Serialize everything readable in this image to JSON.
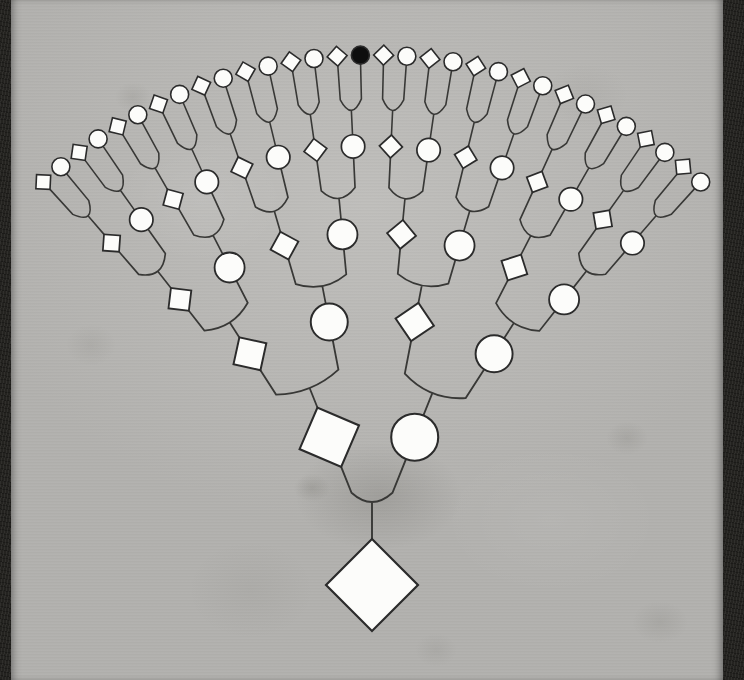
{
  "figure": {
    "paper_color": "#bdbcb9",
    "binding_color": "#242320",
    "shape_fill_color": "#fcfcfa",
    "shape_stroke_color": "#2b2b2b",
    "connector_color": "#383836",
    "filled_node_color": "#0e0e0e"
  },
  "chart_data": {
    "type": "pedigree-fan-tree",
    "pair_rule": "each fork joins a left diamond parent and a right circle parent to one child below",
    "generations": [
      {
        "level": 0,
        "role": "root",
        "nodes": [
          "diamond"
        ]
      },
      {
        "level": 1,
        "nodes": [
          "diamond",
          "circle"
        ]
      },
      {
        "level": 2,
        "nodes": [
          "diamond",
          "circle",
          "diamond",
          "circle"
        ]
      },
      {
        "level": 3,
        "nodes": [
          "diamond",
          "circle",
          "diamond",
          "circle",
          "diamond",
          "circle",
          "diamond",
          "circle"
        ]
      },
      {
        "level": 4,
        "nodes": [
          "diamond",
          "circle",
          "diamond",
          "circle",
          "diamond",
          "circle",
          "diamond",
          "circle",
          "diamond",
          "circle",
          "diamond",
          "circle",
          "diamond",
          "circle",
          "diamond",
          "circle"
        ]
      },
      {
        "level": 5,
        "nodes": [
          "diamond",
          "circle",
          "diamond",
          "circle",
          "diamond",
          "circle",
          "diamond",
          "circle",
          "diamond",
          "circle",
          "diamond",
          "circle",
          "diamond",
          "circle",
          "diamond",
          "circle",
          "diamond",
          "circle",
          "diamond",
          "circle",
          "diamond",
          "circle",
          "diamond",
          "circle",
          "diamond",
          "circle",
          "diamond",
          "circle",
          "diamond",
          "circle",
          "diamond",
          "circle"
        ]
      }
    ],
    "filled_node": {
      "generation": 5,
      "index": 15,
      "shape": "circle"
    },
    "node_counts_per_generation": [
      1,
      2,
      4,
      8,
      16,
      32
    ],
    "layout": {
      "canvas": [
        744,
        680
      ],
      "focus": [
        372,
        544
      ],
      "fan_span_deg": 87.2,
      "radii": [
        -41,
        115,
        226,
        311,
        398,
        489
      ],
      "circle_radii": [
        0,
        23.5,
        18.5,
        15,
        11.7,
        9
      ],
      "diamond_half_diagonals": [
        46,
        32,
        19.5,
        14.5,
        11.5,
        10
      ],
      "bracket_position_ratio": 0.35,
      "bracket_position_ratio_root": 0.45,
      "bracket_flare_ratio": 0.16
    }
  }
}
